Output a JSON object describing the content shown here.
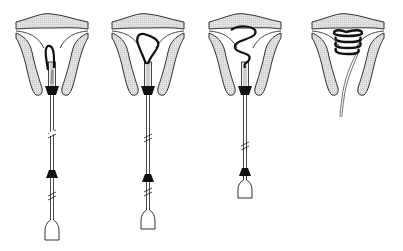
{
  "diagram": {
    "title": "IUD insertion sequence",
    "colors": {
      "tissue_fill": "#d9d9d9",
      "outline": "#1a1a1a",
      "device": "#111111",
      "background": "#ffffff"
    },
    "stages": [
      {
        "index": 1,
        "label": "Stage 1",
        "state": "device loaded in inserter, tip emerging"
      },
      {
        "index": 2,
        "label": "Stage 2",
        "state": "device partially expelled, loop forming"
      },
      {
        "index": 3,
        "label": "Stage 3",
        "state": "device mostly expelled, S-curve"
      },
      {
        "index": 4,
        "label": "Stage 4",
        "state": "device fully deployed as coil, inserter withdrawn, threads trailing"
      }
    ]
  }
}
